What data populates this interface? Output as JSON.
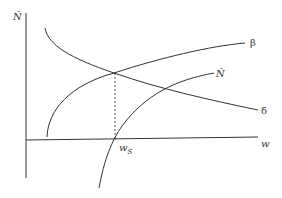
{
  "diagram": {
    "type": "economic-curve-diagram",
    "axes": {
      "y_label": "Ñ",
      "x_label": "w"
    },
    "curves": [
      {
        "name": "beta",
        "label": "β",
        "shape": "increasing concave"
      },
      {
        "name": "delta",
        "label": "δ",
        "shape": "decreasing convex"
      },
      {
        "name": "n-tilde",
        "label": "Ñ",
        "shape": "increasing concave, crosses w-axis at w_S"
      }
    ],
    "annotations": {
      "ws_main": "w",
      "ws_sub": "S",
      "dashed_line": "vertical from β–δ intersection down to w_S"
    },
    "colors": {
      "line": "#333333",
      "background": "#ffffff"
    }
  }
}
